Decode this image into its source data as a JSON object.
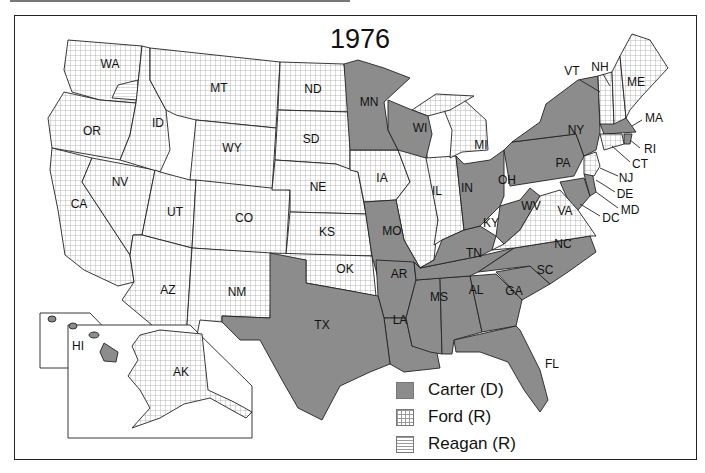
{
  "map": {
    "title": "1976",
    "colors": {
      "carter": "#8c8c8c",
      "ford_pattern": "crosshatch",
      "reagan_pattern": "horizontal-lines",
      "border": "#222222"
    },
    "legend": [
      {
        "key": "carter",
        "label": "Carter (D)"
      },
      {
        "key": "ford",
        "label": "Ford (R)"
      },
      {
        "key": "reagan",
        "label": "Reagan (R)"
      }
    ],
    "states": {
      "WA": "WA",
      "OR": "OR",
      "CA": "CA",
      "NV": "NV",
      "ID": "ID",
      "MT": "MT",
      "WY": "WY",
      "UT": "UT",
      "AZ": "AZ",
      "CO": "CO",
      "NM": "NM",
      "ND": "ND",
      "SD": "SD",
      "NE": "NE",
      "KS": "KS",
      "OK": "OK",
      "TX": "TX",
      "MN": "MN",
      "IA": "IA",
      "MO": "MO",
      "AR": "AR",
      "LA": "LA",
      "WI": "WI",
      "IL": "IL",
      "MI": "MI",
      "IN": "IN",
      "OH": "OH",
      "KY": "KY",
      "TN": "TN",
      "MS": "MS",
      "AL": "AL",
      "GA": "GA",
      "FL": "FL",
      "SC": "SC",
      "NC": "NC",
      "VA": "VA",
      "WV": "WV",
      "PA": "PA",
      "NY": "NY",
      "VT": "VT",
      "NH": "NH",
      "ME": "ME",
      "MA": "MA",
      "RI": "RI",
      "CT": "CT",
      "NJ": "NJ",
      "DE": "DE",
      "MD": "MD",
      "DC": "DC",
      "AK": "AK",
      "HI": "HI"
    },
    "winners": {
      "carter": [
        "MN",
        "WI",
        "MO",
        "AR",
        "LA",
        "TX",
        "MS",
        "AL",
        "GA",
        "FL",
        "SC",
        "NC",
        "TN",
        "KY",
        "WV",
        "OH",
        "PA",
        "NY",
        "MA",
        "RI",
        "DE",
        "MD",
        "DC",
        "HI"
      ],
      "ford": [
        "WA",
        "OR",
        "CA",
        "NV",
        "ID",
        "MT",
        "WY",
        "UT",
        "AZ",
        "CO",
        "NM",
        "ND",
        "SD",
        "NE",
        "KS",
        "OK",
        "IA",
        "IL",
        "MI",
        "IN",
        "VA",
        "NJ",
        "CT",
        "VT",
        "NH",
        "ME",
        "AK"
      ],
      "reagan": [
        "WA (1 elector)"
      ]
    }
  }
}
